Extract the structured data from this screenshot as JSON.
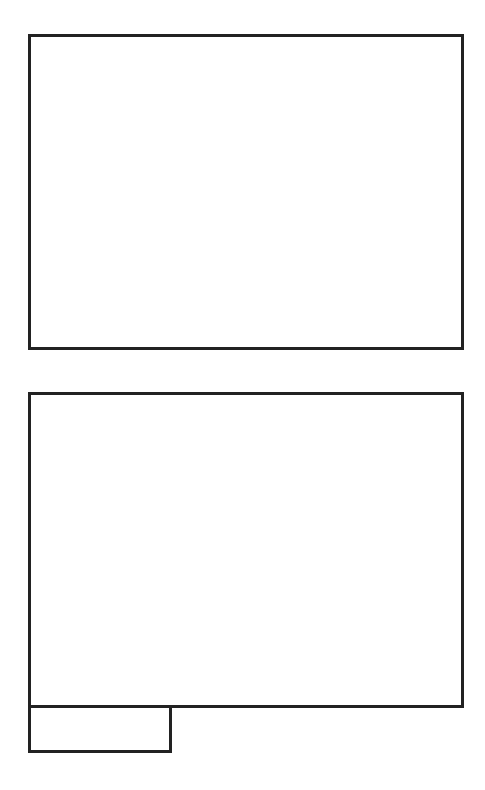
{
  "page": {
    "background": "#ffffff",
    "border_color": "#222222"
  },
  "panels": [
    {
      "id": "panel-top",
      "label": ""
    },
    {
      "id": "panel-bottom",
      "label": ""
    },
    {
      "id": "panel-tab",
      "label": ""
    }
  ]
}
